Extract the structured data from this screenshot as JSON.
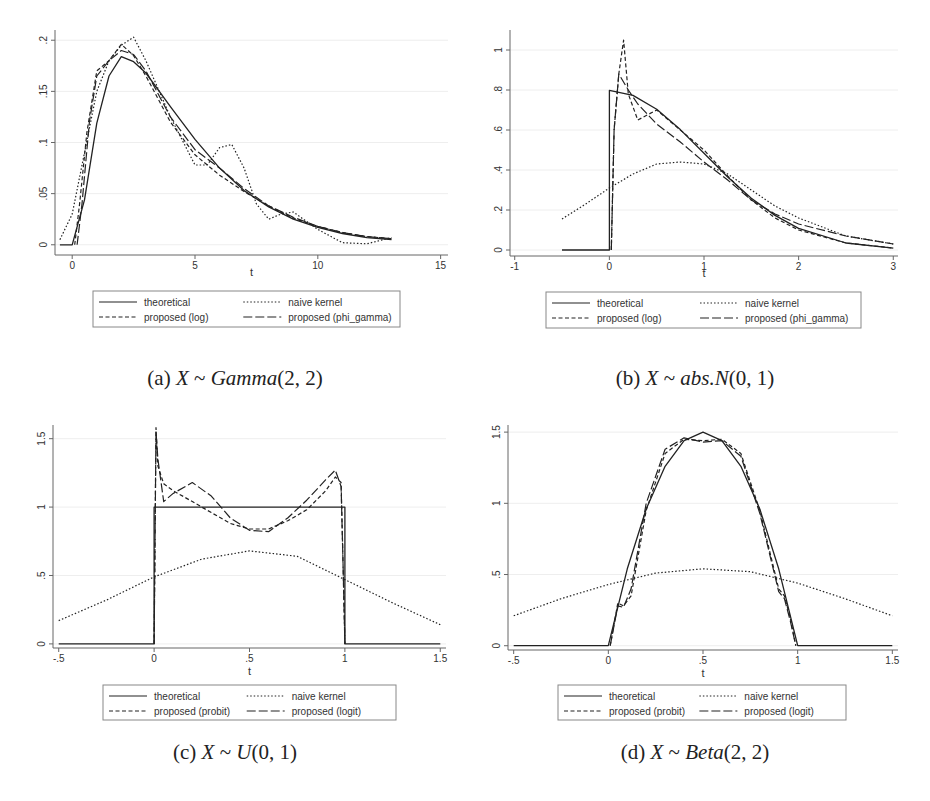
{
  "figure": {
    "captions": [
      {
        "label": "(a)",
        "var": "X",
        "tilde": "~",
        "dist": "Gamma",
        "params": "(2, 2)"
      },
      {
        "label": "(b)",
        "var": "X",
        "tilde": "~",
        "dist": "abs.N",
        "params": "(0, 1)"
      },
      {
        "label": "(c)",
        "var": "X",
        "tilde": "~",
        "dist": "U",
        "params": "(0, 1)"
      },
      {
        "label": "(d)",
        "var": "X",
        "tilde": "~",
        "dist": "Beta",
        "params": "(2, 2)"
      }
    ]
  },
  "colors": {
    "line": "#222222",
    "axis": "#666666",
    "grid": "#eeeeee",
    "legend_border": "#888888"
  },
  "chart_data": [
    {
      "type": "line",
      "panel": "a",
      "title": "(a) X ~ Gamma(2, 2)",
      "xlabel": "t",
      "ylabel": "",
      "xlim": [
        -0.7,
        15.3
      ],
      "ylim": [
        -0.01,
        0.21
      ],
      "xticks": [
        "0",
        "5",
        "10",
        "15"
      ],
      "xtick_values": [
        0,
        5,
        10,
        15
      ],
      "yticks": [
        "0",
        ".05",
        ".1",
        ".15",
        ".2"
      ],
      "ytick_values": [
        0,
        0.05,
        0.1,
        0.15,
        0.2
      ],
      "grid": true,
      "legend_position": "bottom",
      "legend": [
        "theoretical",
        "naive kernel",
        "proposed (log)",
        "proposed (phi_gamma)"
      ],
      "series": [
        {
          "name": "theoretical",
          "style": "solid",
          "x": [
            -0.5,
            0,
            0.5,
            1,
            1.5,
            2,
            2.5,
            3,
            4,
            5,
            6,
            7,
            8,
            9,
            10,
            11,
            12,
            13
          ],
          "values": [
            0,
            0,
            0.044,
            0.119,
            0.165,
            0.184,
            0.179,
            0.168,
            0.135,
            0.103,
            0.075,
            0.053,
            0.037,
            0.025,
            0.017,
            0.011,
            0.007,
            0.005
          ]
        },
        {
          "name": "naive kernel",
          "style": "dotted",
          "x": [
            -0.5,
            0,
            0.5,
            1,
            1.5,
            2,
            2.5,
            3,
            4,
            5,
            5.5,
            6,
            6.5,
            7,
            7.5,
            8,
            8.5,
            9,
            10,
            11,
            12,
            13
          ],
          "values": [
            0.005,
            0.03,
            0.09,
            0.15,
            0.18,
            0.195,
            0.203,
            0.18,
            0.125,
            0.078,
            0.078,
            0.095,
            0.098,
            0.075,
            0.04,
            0.025,
            0.03,
            0.032,
            0.015,
            0.002,
            0.001,
            0.007
          ]
        },
        {
          "name": "proposed (log)",
          "style": "dashed",
          "x": [
            0.1,
            0.3,
            0.6,
            1,
            1.5,
            2,
            2.5,
            3,
            4,
            5,
            6,
            7,
            8,
            9,
            10,
            11,
            12,
            13
          ],
          "values": [
            0,
            0.04,
            0.11,
            0.17,
            0.18,
            0.196,
            0.185,
            0.165,
            0.12,
            0.088,
            0.068,
            0.052,
            0.038,
            0.026,
            0.018,
            0.012,
            0.008,
            0.006
          ]
        },
        {
          "name": "proposed (phi_gamma)",
          "style": "longdash",
          "x": [
            0.2,
            0.4,
            0.7,
            1,
            1.5,
            2,
            2.5,
            3,
            4,
            5,
            6,
            7,
            8,
            9,
            10,
            11,
            12,
            13
          ],
          "values": [
            0,
            0.04,
            0.12,
            0.165,
            0.18,
            0.19,
            0.186,
            0.17,
            0.125,
            0.093,
            0.075,
            0.055,
            0.038,
            0.027,
            0.018,
            0.012,
            0.008,
            0.006
          ]
        }
      ]
    },
    {
      "type": "line",
      "panel": "b",
      "title": "(b) X ~ abs.N(0, 1)",
      "xlabel": "t",
      "ylabel": "",
      "xlim": [
        -1.05,
        3.05
      ],
      "ylim": [
        -0.03,
        1.1
      ],
      "xticks": [
        "-1",
        "0",
        "1",
        "2",
        "3"
      ],
      "xtick_values": [
        -1,
        0,
        1,
        2,
        3
      ],
      "yticks": [
        "0",
        ".2",
        ".4",
        ".6",
        ".8",
        "1"
      ],
      "ytick_values": [
        0,
        0.2,
        0.4,
        0.6,
        0.8,
        1
      ],
      "grid": true,
      "legend_position": "bottom",
      "legend": [
        "theoretical",
        "naive kernel",
        "proposed (log)",
        "proposed (phi_gamma)"
      ],
      "series": [
        {
          "name": "theoretical",
          "style": "solid",
          "x": [
            -0.5,
            0,
            0,
            0.25,
            0.5,
            0.75,
            1,
            1.25,
            1.5,
            1.75,
            2,
            2.5,
            3
          ],
          "values": [
            0,
            0,
            0.798,
            0.773,
            0.704,
            0.602,
            0.484,
            0.365,
            0.259,
            0.173,
            0.108,
            0.035,
            0.009
          ]
        },
        {
          "name": "naive kernel",
          "style": "dotted",
          "x": [
            -0.5,
            -0.25,
            0,
            0.25,
            0.5,
            0.75,
            1,
            1.25,
            1.5,
            1.75,
            2,
            2.5,
            3
          ],
          "values": [
            0.155,
            0.23,
            0.31,
            0.38,
            0.43,
            0.44,
            0.43,
            0.38,
            0.3,
            0.22,
            0.16,
            0.07,
            0.03
          ]
        },
        {
          "name": "proposed (log)",
          "style": "dashed",
          "x": [
            0.02,
            0.05,
            0.1,
            0.15,
            0.2,
            0.3,
            0.5,
            0.75,
            1,
            1.25,
            1.5,
            1.75,
            2,
            2.5,
            3
          ],
          "values": [
            0,
            0.6,
            0.88,
            1.05,
            0.78,
            0.65,
            0.7,
            0.6,
            0.5,
            0.37,
            0.25,
            0.16,
            0.1,
            0.035,
            0.01
          ]
        },
        {
          "name": "proposed (phi_gamma)",
          "style": "longdash",
          "x": [
            0.02,
            0.05,
            0.1,
            0.2,
            0.3,
            0.5,
            0.75,
            1,
            1.25,
            1.5,
            1.75,
            2,
            2.5,
            3
          ],
          "values": [
            0,
            0.6,
            0.88,
            0.8,
            0.73,
            0.63,
            0.54,
            0.44,
            0.35,
            0.25,
            0.18,
            0.13,
            0.07,
            0.03
          ]
        }
      ]
    },
    {
      "type": "line",
      "panel": "c",
      "title": "(c) X ~ U(0, 1)",
      "xlabel": "t",
      "ylabel": "",
      "xlim": [
        -0.53,
        1.53
      ],
      "ylim": [
        -0.03,
        1.6
      ],
      "xticks": [
        "-.5",
        "0",
        ".5",
        "1",
        "1.5"
      ],
      "xtick_values": [
        -0.5,
        0,
        0.5,
        1,
        1.5
      ],
      "yticks": [
        "0",
        ".5",
        "1",
        "1.5"
      ],
      "ytick_values": [
        0,
        0.5,
        1,
        1.5
      ],
      "grid": true,
      "legend_position": "bottom",
      "legend": [
        "theoretical",
        "naive kernel",
        "proposed (probit)",
        "proposed (logit)"
      ],
      "series": [
        {
          "name": "theoretical",
          "style": "solid",
          "x": [
            -0.5,
            0,
            0,
            1,
            1,
            1.5
          ],
          "values": [
            0,
            0,
            1,
            1,
            0,
            0
          ]
        },
        {
          "name": "naive kernel",
          "style": "dotted",
          "x": [
            -0.5,
            -0.25,
            0,
            0.25,
            0.5,
            0.75,
            1,
            1.25,
            1.5
          ],
          "values": [
            0.17,
            0.32,
            0.49,
            0.62,
            0.68,
            0.64,
            0.47,
            0.3,
            0.14
          ]
        },
        {
          "name": "proposed (probit)",
          "style": "dashed",
          "x": [
            0,
            0.01,
            0.02,
            0.05,
            0.1,
            0.2,
            0.3,
            0.4,
            0.5,
            0.6,
            0.7,
            0.8,
            0.9,
            0.95,
            0.98,
            0.99,
            1
          ],
          "values": [
            0,
            1.58,
            1.3,
            1.17,
            1.12,
            1.04,
            0.96,
            0.88,
            0.84,
            0.84,
            0.9,
            0.98,
            1.12,
            1.22,
            1.18,
            0.6,
            0
          ]
        },
        {
          "name": "proposed (logit)",
          "style": "longdash",
          "x": [
            0,
            0.01,
            0.02,
            0.05,
            0.1,
            0.2,
            0.3,
            0.4,
            0.5,
            0.6,
            0.7,
            0.8,
            0.9,
            0.95,
            0.98,
            0.99,
            1
          ],
          "values": [
            0,
            1.55,
            1.35,
            1.04,
            1.1,
            1.18,
            1.08,
            0.92,
            0.83,
            0.82,
            0.92,
            1.05,
            1.2,
            1.27,
            1.15,
            0.6,
            0
          ]
        }
      ]
    },
    {
      "type": "line",
      "panel": "d",
      "title": "(d) X ~ Beta(2, 2)",
      "xlabel": "t",
      "ylabel": "",
      "xlim": [
        -0.53,
        1.53
      ],
      "ylim": [
        -0.03,
        1.55
      ],
      "xticks": [
        "-.5",
        "0",
        ".5",
        "1",
        "1.5"
      ],
      "xtick_values": [
        -0.5,
        0,
        0.5,
        1,
        1.5
      ],
      "yticks": [
        "0",
        ".5",
        "1",
        "1.5"
      ],
      "ytick_values": [
        0,
        0.5,
        1,
        1.5
      ],
      "grid": true,
      "legend_position": "bottom",
      "legend": [
        "theoretical",
        "naive kernel",
        "proposed (probit)",
        "proposed (logit)"
      ],
      "series": [
        {
          "name": "theoretical",
          "style": "solid",
          "x": [
            -0.5,
            0,
            0.1,
            0.2,
            0.3,
            0.4,
            0.5,
            0.6,
            0.7,
            0.8,
            0.9,
            1,
            1.5
          ],
          "values": [
            0,
            0,
            0.54,
            0.96,
            1.26,
            1.44,
            1.5,
            1.44,
            1.26,
            0.96,
            0.54,
            0,
            0
          ]
        },
        {
          "name": "naive kernel",
          "style": "dotted",
          "x": [
            -0.5,
            -0.25,
            0,
            0.25,
            0.5,
            0.75,
            1,
            1.25,
            1.5
          ],
          "values": [
            0.21,
            0.33,
            0.43,
            0.51,
            0.54,
            0.52,
            0.44,
            0.33,
            0.21
          ]
        },
        {
          "name": "proposed (probit)",
          "style": "dashed",
          "x": [
            0.01,
            0.05,
            0.08,
            0.12,
            0.2,
            0.3,
            0.4,
            0.5,
            0.6,
            0.7,
            0.8,
            0.9,
            0.93,
            0.96,
            0.99
          ],
          "values": [
            0,
            0.3,
            0.28,
            0.35,
            0.95,
            1.35,
            1.45,
            1.44,
            1.45,
            1.35,
            0.95,
            0.4,
            0.35,
            0.2,
            0
          ]
        },
        {
          "name": "proposed (logit)",
          "style": "longdash",
          "x": [
            0.01,
            0.05,
            0.08,
            0.12,
            0.2,
            0.3,
            0.4,
            0.5,
            0.6,
            0.7,
            0.8,
            0.9,
            0.93,
            0.96,
            0.99
          ],
          "values": [
            0,
            0.28,
            0.27,
            0.4,
            1.0,
            1.38,
            1.46,
            1.43,
            1.44,
            1.33,
            0.93,
            0.38,
            0.33,
            0.18,
            0
          ]
        }
      ]
    }
  ],
  "panels_layout": [
    {
      "plot": {
        "left": 55,
        "right": 448,
        "top": 30,
        "bottom": 255
      },
      "legend": {
        "x": 93,
        "y": 291,
        "w": 307,
        "h": 36
      },
      "xlabel_y": 271,
      "caption": {
        "x": 235,
        "y": 366
      }
    },
    {
      "plot": {
        "left": 510,
        "right": 898,
        "top": 30,
        "bottom": 256
      },
      "legend": {
        "x": 546,
        "y": 292,
        "w": 315,
        "h": 36
      },
      "xlabel_y": 272,
      "caption": {
        "x": 695,
        "y": 366
      }
    },
    {
      "plot": {
        "left": 53,
        "right": 446,
        "top": 425,
        "bottom": 648
      },
      "legend": {
        "x": 103,
        "y": 685,
        "w": 293,
        "h": 35
      },
      "xlabel_y": 670,
      "caption": {
        "x": 235,
        "y": 740
      }
    },
    {
      "plot": {
        "left": 508,
        "right": 898,
        "top": 425,
        "bottom": 650
      },
      "legend": {
        "x": 558,
        "y": 685,
        "w": 288,
        "h": 35
      },
      "xlabel_y": 672,
      "caption": {
        "x": 695,
        "y": 740
      }
    }
  ]
}
